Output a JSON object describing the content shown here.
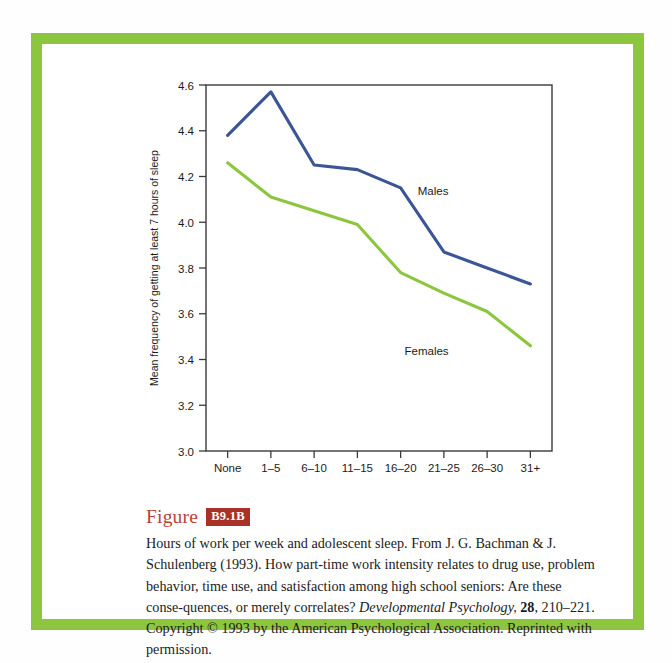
{
  "frame": {
    "border_color": "#8cc63f",
    "background": "#ffffff"
  },
  "chart_data": {
    "type": "line",
    "title": "",
    "xlabel": "Work hours per week",
    "ylabel": "Mean frequency of getting at least 7 hours of sleep",
    "categories": [
      "None",
      "1–5",
      "6–10",
      "11–15",
      "16–20",
      "21–25",
      "26–30",
      "31+"
    ],
    "ylim": [
      3.0,
      4.6
    ],
    "ytick_labels": [
      "3.0",
      "3.2",
      "3.4",
      "3.6",
      "3.8",
      "4.0",
      "4.2",
      "4.4",
      "4.6"
    ],
    "ytick_values": [
      3.0,
      3.2,
      3.4,
      3.6,
      3.8,
      4.0,
      4.2,
      4.4,
      4.6
    ],
    "grid": false,
    "legend_position": "inline-annotations",
    "series": [
      {
        "name": "Males",
        "color": "#3b5595",
        "values": [
          4.38,
          4.57,
          4.25,
          4.23,
          4.15,
          3.87,
          3.8,
          3.73
        ],
        "label_x_index": 4.75,
        "label_y": 4.12
      },
      {
        "name": "Females",
        "color": "#8cc63f",
        "values": [
          4.26,
          4.11,
          4.05,
          3.99,
          3.78,
          3.69,
          3.61,
          3.46
        ],
        "label_x_index": 4.6,
        "label_y": 3.42
      }
    ]
  },
  "caption": {
    "figure_word": "Figure",
    "figure_number": "B9.1B",
    "text_parts": {
      "p1": "Hours of work per week and adolescent sleep. From J. G. Bachman & J. Schulenberg (1993). How part-time work intensity relates to drug use, problem behavior, time use, and satisfaction among high school seniors: Are these conse-quences, or merely correlates? ",
      "journal": "Developmental Psychology,",
      "p2": " ",
      "volume": "28",
      "p3": ", 210–221. Copyright © 1993 by the American Psychological Association. Reprinted with permission."
    }
  }
}
